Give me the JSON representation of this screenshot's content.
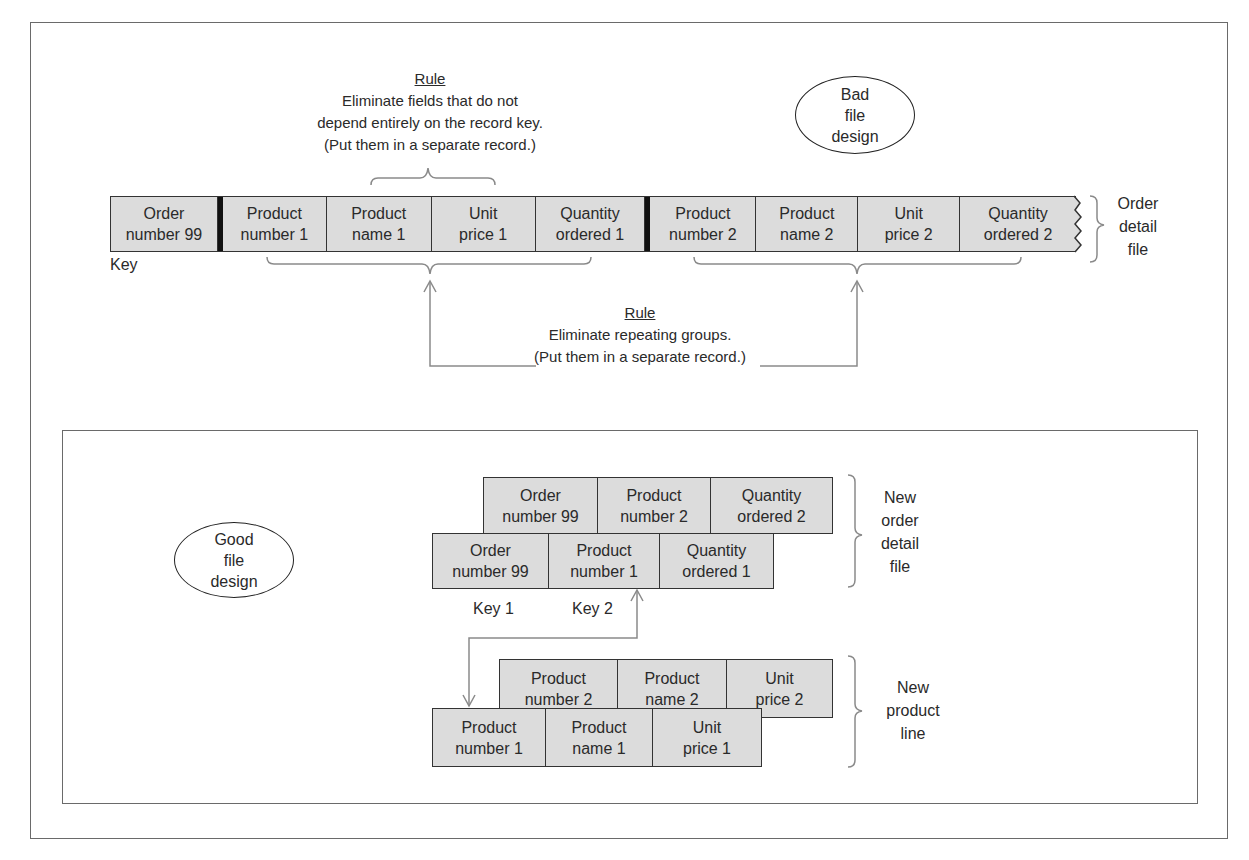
{
  "top_section": {
    "rule1": {
      "title": "Rule",
      "lines": [
        "Eliminate fields that do not",
        "depend entirely on the record key.",
        "(Put them in a separate record.)"
      ]
    },
    "badge": {
      "lines": [
        "Bad",
        "file",
        "design"
      ]
    },
    "order_detail_record": {
      "cells": [
        {
          "line1": "Order",
          "line2": "number 99"
        },
        {
          "line1": "Product",
          "line2": "number 1"
        },
        {
          "line1": "Product",
          "line2": "name 1"
        },
        {
          "line1": "Unit",
          "line2": "price 1"
        },
        {
          "line1": "Quantity",
          "line2": "ordered 1"
        },
        {
          "line1": "Product",
          "line2": "number 2"
        },
        {
          "line1": "Product",
          "line2": "name 2"
        },
        {
          "line1": "Unit",
          "line2": "price 2"
        },
        {
          "line1": "Quantity",
          "line2": "ordered 2"
        }
      ],
      "key_label": "Key"
    },
    "file_label": {
      "lines": [
        "Order",
        "detail",
        "file"
      ]
    },
    "rule2": {
      "title": "Rule",
      "lines": [
        "Eliminate repeating groups.",
        "(Put them in a separate record.)"
      ]
    }
  },
  "bottom_section": {
    "badge": {
      "lines": [
        "Good",
        "file",
        "design"
      ]
    },
    "new_order_detail": {
      "back_record": [
        {
          "line1": "Order",
          "line2": "number 99"
        },
        {
          "line1": "Product",
          "line2": "number 2"
        },
        {
          "line1": "Quantity",
          "line2": "ordered 2"
        }
      ],
      "front_record": [
        {
          "line1": "Order",
          "line2": "number 99"
        },
        {
          "line1": "Product",
          "line2": "number 1"
        },
        {
          "line1": "Quantity",
          "line2": "ordered 1"
        }
      ],
      "key1_label": "Key 1",
      "key2_label": "Key 2",
      "file_label": [
        "New",
        "order",
        "detail",
        "file"
      ]
    },
    "new_product_line": {
      "back_record": [
        {
          "line1": "Product",
          "line2": "number 2"
        },
        {
          "line1": "Product",
          "line2": "name 2"
        },
        {
          "line1": "Unit",
          "line2": "price 2"
        }
      ],
      "front_record": [
        {
          "line1": "Product",
          "line2": "number 1"
        },
        {
          "line1": "Product",
          "line2": "name 1"
        },
        {
          "line1": "Unit",
          "line2": "price 1"
        }
      ],
      "file_label": [
        "New",
        "product",
        "line"
      ]
    }
  },
  "colors": {
    "cell_fill": "#dcdcdc",
    "line": "#333333",
    "connector": "#8a8a8a"
  }
}
